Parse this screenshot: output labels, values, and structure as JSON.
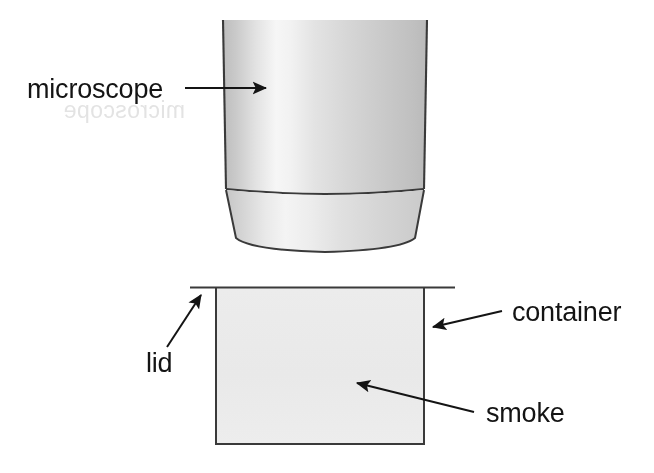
{
  "figure": {
    "background_color": "#ffffff",
    "width": 654,
    "height": 473,
    "stroke_color": "#2b2b2b",
    "labels": {
      "microscope": "microscope",
      "container": "container",
      "lid": "lid",
      "smoke": "smoke"
    },
    "parts": [
      {
        "name": "microscope-barrel",
        "shape": "cylinder",
        "fill_light": "#f2f2f2",
        "fill_dark": "#b9b9b9",
        "x": 222,
        "y": 20,
        "width": 205,
        "height": 172
      },
      {
        "name": "microscope-objective",
        "shape": "tapered-trapezoid",
        "fill_light": "#eeeeee",
        "fill_dark": "#c2c2c2",
        "y_top": 192,
        "y_bottom": 250
      },
      {
        "name": "container-box",
        "shape": "rectangle",
        "fill": "#ebebeb",
        "x": 215,
        "y": 287,
        "width": 210,
        "height": 158
      },
      {
        "name": "container-lid",
        "shape": "line",
        "x1": 190,
        "y1": 287,
        "x2": 455,
        "y2": 287
      }
    ],
    "arrows": [
      {
        "name": "microscope-arrow",
        "from_x": 185,
        "from_y": 88,
        "to_x": 272,
        "to_y": 88,
        "direction": "right"
      },
      {
        "name": "container-arrow",
        "from_x": 502,
        "from_y": 311,
        "to_x": 428,
        "to_y": 328,
        "direction": "left"
      },
      {
        "name": "lid-arrow",
        "from_x": 168,
        "from_y": 346,
        "to_x": 204,
        "to_y": 291,
        "direction": "up-right"
      },
      {
        "name": "smoke-arrow",
        "from_x": 474,
        "from_y": 412,
        "to_x": 351,
        "to_y": 381,
        "direction": "up-left"
      }
    ],
    "ghost_text": [
      {
        "name": "ghost-line-1",
        "text": "microscope",
        "x": 55,
        "y": 116
      },
      {
        "name": "ghost-line-2",
        "text": "instruction",
        "x": 285,
        "y": 212
      },
      {
        "name": "ghost-line-3",
        "text": "observation",
        "x": 190,
        "y": 330
      }
    ]
  }
}
